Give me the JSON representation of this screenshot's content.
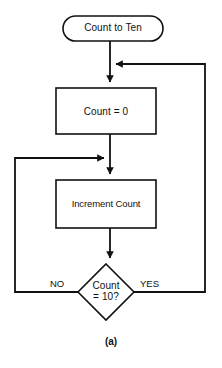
{
  "figure": {
    "caption": "(a)",
    "background_color": "#ffffff",
    "stroke_color": "#111111",
    "text_color": "#111111"
  },
  "diagram": {
    "type": "flowchart",
    "title": "Count to Ten",
    "nodes": [
      {
        "id": "terminal-start",
        "shape": "terminator",
        "label": "Count to Ten"
      },
      {
        "id": "process-init",
        "shape": "process",
        "label": "Count = 0"
      },
      {
        "id": "process-increment",
        "shape": "process",
        "label": "Increment Count"
      },
      {
        "id": "decision-check",
        "shape": "decision",
        "label_line_1": "Count",
        "label_line_2": "= 10?"
      }
    ],
    "branches": {
      "no_label": "NO",
      "yes_label": "YES"
    },
    "edges": [
      {
        "from": "terminal-start",
        "to": "process-init",
        "label": ""
      },
      {
        "from": "process-init",
        "to": "process-increment",
        "label": ""
      },
      {
        "from": "process-increment",
        "to": "decision-check",
        "label": ""
      },
      {
        "from": "decision-check",
        "to": "process-increment",
        "label": "NO"
      },
      {
        "from": "decision-check",
        "to": "process-init",
        "label": "YES"
      }
    ]
  }
}
